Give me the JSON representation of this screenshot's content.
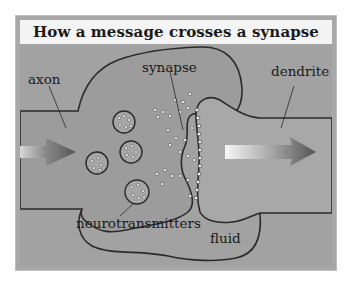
{
  "title": "How a message crosses a synapse",
  "labels": {
    "axon": "axon",
    "synapse": "synapse",
    "dendrite": "dendrite",
    "neurotransmitters": "neurotransmitters",
    "fluid": "fluid"
  },
  "colors": {
    "frame": "#a8a8a8",
    "title_band": "#f4f4f4",
    "background_fluid": "#a4a4a4",
    "neuron_fill": "#9a9a9a",
    "outline": "#2a2a2a",
    "arrow_dark": "#5a5a5a",
    "arrow_light": "#f0f0f0"
  },
  "signal_direction": "left-to-right"
}
